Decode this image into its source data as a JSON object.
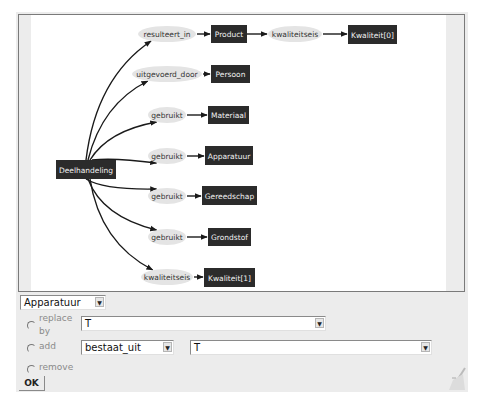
{
  "diagram": {
    "root": {
      "label": "Deelhandeling",
      "x": 37,
      "y": 145,
      "w": 60,
      "h": 19
    },
    "relations": [
      {
        "label": "resulteert_in",
        "cx": 148,
        "cy": 19,
        "rx": 29,
        "ry": 8,
        "target": {
          "label": "Product",
          "x": 192,
          "y": 10,
          "w": 36,
          "h": 18
        }
      },
      {
        "label": "uitgevoerd_door",
        "cx": 148,
        "cy": 59,
        "rx": 35,
        "ry": 8,
        "target": {
          "label": "Persoon",
          "x": 192,
          "y": 50,
          "w": 39,
          "h": 18
        }
      },
      {
        "label": "gebruikt",
        "cx": 148,
        "cy": 100,
        "rx": 19,
        "ry": 8,
        "target": {
          "label": "Materiaal",
          "x": 189,
          "y": 91,
          "w": 41,
          "h": 18
        }
      },
      {
        "label": "gebruikt",
        "cx": 148,
        "cy": 141,
        "rx": 19,
        "ry": 8,
        "target": {
          "label": "Apparatuur",
          "x": 186,
          "y": 131,
          "w": 48,
          "h": 19
        }
      },
      {
        "label": "gebruikt",
        "cx": 148,
        "cy": 181,
        "rx": 19,
        "ry": 8,
        "target": {
          "label": "Gereedschap",
          "x": 183,
          "y": 171,
          "w": 55,
          "h": 19
        }
      },
      {
        "label": "gebruikt",
        "cx": 148,
        "cy": 222,
        "rx": 19,
        "ry": 8,
        "target": {
          "label": "Grondstof",
          "x": 189,
          "y": 213,
          "w": 43,
          "h": 18
        }
      },
      {
        "label": "kwaliteitseis",
        "cx": 148,
        "cy": 262,
        "rx": 26,
        "ry": 8,
        "target": {
          "label": "Kwaliteit[1]",
          "x": 185,
          "y": 253,
          "w": 51,
          "h": 19
        }
      }
    ],
    "secondary": {
      "from": "Product",
      "label": "kwaliteitseis",
      "cx": 276,
      "cy": 19,
      "rx": 27,
      "ry": 8,
      "target": {
        "label": "Kwaliteit[0]",
        "x": 329,
        "y": 10,
        "w": 49,
        "h": 19
      }
    },
    "colors": {
      "box": "#2b2b2b",
      "ellipse": "#e4e4e4",
      "edge": "#1a1a1a"
    }
  },
  "controls": {
    "node_select": {
      "value": "Apparatuur"
    },
    "replace": {
      "label_line1": "replace",
      "label_line2": "by",
      "value": "T"
    },
    "add": {
      "label": "add",
      "relation_value": "bestaat_uit",
      "target_value": "T"
    },
    "remove": {
      "label": "remove"
    },
    "ok_label": "OK",
    "arrow_glyph": "▼"
  }
}
